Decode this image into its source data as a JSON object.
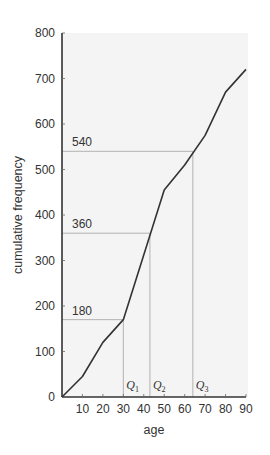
{
  "chart_data": {
    "type": "line",
    "title": "",
    "xlabel": "age",
    "ylabel": "cumulative frequency",
    "xlim": [
      0,
      90
    ],
    "ylim": [
      0,
      800
    ],
    "x_ticks": [
      10,
      20,
      30,
      40,
      50,
      60,
      70,
      80,
      90
    ],
    "y_ticks": [
      0,
      100,
      200,
      300,
      400,
      500,
      600,
      700,
      800
    ],
    "grid": false,
    "series": [
      {
        "name": "cumulative frequency",
        "x": [
          0,
          10,
          20,
          30,
          50,
          60,
          70,
          80,
          90
        ],
        "values": [
          0,
          45,
          120,
          170,
          455,
          510,
          575,
          670,
          720
        ]
      }
    ],
    "annotations": [
      {
        "label": "180",
        "y": 170,
        "x_end": 30,
        "quartile": "Q1",
        "subscript": "1"
      },
      {
        "label": "360",
        "y": 360,
        "x_end": 43,
        "quartile": "Q2",
        "subscript": "2"
      },
      {
        "label": "540",
        "y": 540,
        "x_end": 64,
        "quartile": "Q3",
        "subscript": "3"
      }
    ],
    "colors": {
      "line": "#333333",
      "guide": "#aaaaaa",
      "plot_bg": "#f4f4f4"
    }
  }
}
